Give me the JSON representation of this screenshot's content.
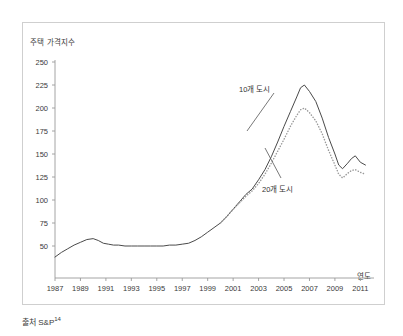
{
  "chart_data": {
    "type": "line",
    "title": "",
    "ylabel": "주택 가격지수",
    "xlabel": "연도",
    "ylim": [
      25,
      250
    ],
    "xlim": [
      1987,
      2011.6
    ],
    "grid": false,
    "legend_position": "inline-annotations",
    "ytick_labels": [
      "250",
      "225",
      "200",
      "175",
      "150",
      "125",
      "100",
      "75",
      "50"
    ],
    "ytick_values": [
      250,
      225,
      200,
      175,
      150,
      125,
      100,
      75,
      50
    ],
    "xtick_labels": [
      "1987",
      "1989",
      "1991",
      "1993",
      "1995",
      "1997",
      "1999",
      "2001",
      "2003",
      "2005",
      "2007",
      "2009",
      "2011"
    ],
    "xtick_values": [
      1987,
      1989,
      1991,
      1993,
      1995,
      1997,
      1999,
      2001,
      2003,
      2005,
      2007,
      2009,
      2011
    ],
    "annotations": [
      {
        "label": "10개 도시",
        "points_to_series": "10개 도시"
      },
      {
        "label": "20개 도시",
        "points_to_series": "20개 도시"
      }
    ],
    "series": [
      {
        "name": "10개 도시",
        "style": "solid",
        "color": "#4a4a4a",
        "x": [
          1987.0,
          1987.5,
          1988.0,
          1988.5,
          1989.0,
          1989.5,
          1990.0,
          1990.4,
          1990.8,
          1991.2,
          1991.6,
          1992.0,
          1992.5,
          1993.0,
          1993.5,
          1994.0,
          1994.5,
          1995.0,
          1995.5,
          1996.0,
          1996.5,
          1997.0,
          1997.5,
          1998.0,
          1998.5,
          1999.0,
          1999.5,
          2000.0,
          2000.5,
          2001.0,
          2001.5,
          2002.0,
          2002.5,
          2003.0,
          2003.5,
          2004.0,
          2004.5,
          2005.0,
          2005.5,
          2006.0,
          2006.3,
          2006.6,
          2007.0,
          2007.5,
          2008.0,
          2008.5,
          2009.0,
          2009.3,
          2009.6,
          2010.0,
          2010.3,
          2010.6,
          2011.0,
          2011.4
        ],
        "y": [
          38,
          43,
          47,
          51,
          54,
          57,
          58,
          56,
          53,
          52,
          51,
          51,
          50,
          50,
          50,
          50,
          50,
          50,
          50,
          51,
          51,
          52,
          53,
          56,
          60,
          65,
          70,
          75,
          82,
          90,
          98,
          106,
          112,
          122,
          133,
          147,
          163,
          180,
          196,
          212,
          222,
          225,
          218,
          207,
          189,
          168,
          150,
          138,
          134,
          140,
          145,
          148,
          141,
          138
        ]
      },
      {
        "name": "20개 도시",
        "style": "dotted",
        "color": "#9a9a9a",
        "x": [
          2000.0,
          2000.5,
          2001.0,
          2001.5,
          2002.0,
          2002.5,
          2003.0,
          2003.5,
          2004.0,
          2004.5,
          2005.0,
          2005.5,
          2006.0,
          2006.3,
          2006.6,
          2007.0,
          2007.5,
          2008.0,
          2008.5,
          2009.0,
          2009.3,
          2009.6,
          2010.0,
          2010.3,
          2010.6,
          2011.0,
          2011.4
        ],
        "y": [
          75,
          82,
          90,
          97,
          104,
          110,
          118,
          128,
          140,
          153,
          166,
          180,
          192,
          198,
          200,
          195,
          186,
          172,
          154,
          138,
          128,
          124,
          129,
          132,
          133,
          130,
          128
        ]
      }
    ]
  },
  "source": {
    "prefix": "출처 S&P",
    "superscript": "14"
  }
}
